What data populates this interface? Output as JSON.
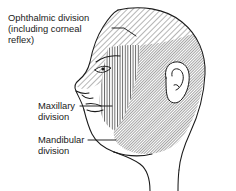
{
  "figure": {
    "title": "Trigeminal nerve sensory divisions of the face",
    "background_color": "#ffffff",
    "line_color": "#1a1a1a",
    "labels": {
      "ophthalmic": {
        "line1": "Ophthalmic division",
        "line2": "(including corneal",
        "line3": "reflex)"
      },
      "maxillary": {
        "line1": "Maxillary",
        "line2": "division"
      },
      "mandibular": {
        "line1": "Mandibular",
        "line2": "division"
      }
    },
    "regions": [
      {
        "name": "ophthalmic-region",
        "label": "Ophthalmic division (including corneal reflex)",
        "hatch": "diagonal-sparse",
        "hatch_color": "#3a3a3a"
      },
      {
        "name": "maxillary-region",
        "label": "Maxillary division",
        "hatch": "vertical",
        "hatch_color": "#3a3a3a"
      },
      {
        "name": "mandibular-region",
        "label": "Mandibular division",
        "hatch": "diagonal-dense",
        "hatch_color": "#2b2b2b"
      }
    ],
    "anatomy": [
      "head-profile-outline",
      "ear",
      "eye",
      "nose",
      "lips",
      "neck"
    ]
  }
}
